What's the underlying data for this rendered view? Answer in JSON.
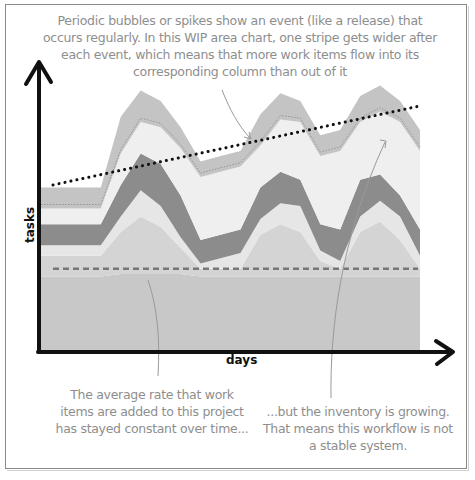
{
  "chart_data": {
    "type": "area",
    "title": "",
    "xlabel": "days",
    "ylabel": "tasks",
    "grid": false,
    "legend": "none",
    "x": [
      0,
      1,
      2,
      3,
      4,
      5,
      6,
      7,
      8,
      9,
      10,
      11,
      12,
      13,
      14,
      15,
      16,
      17,
      18,
      19
    ],
    "ylim": [
      0,
      100
    ],
    "series": [
      {
        "name": "done",
        "color": "#c8c8c8",
        "values": [
          28,
          28,
          28,
          28,
          29,
          29,
          29,
          29,
          28,
          28,
          28,
          28,
          28,
          28,
          28,
          28,
          28,
          28,
          28,
          28
        ]
      },
      {
        "name": "stage-4",
        "color": "#d4d4d4",
        "values": [
          8,
          8,
          8,
          8,
          16,
          22,
          18,
          10,
          3,
          3,
          3,
          16,
          20,
          17,
          6,
          3,
          17,
          21,
          14,
          3
        ]
      },
      {
        "name": "stage-3",
        "color": "#e6e6e6",
        "values": [
          4,
          4,
          4,
          4,
          6,
          10,
          8,
          4,
          2,
          4,
          6,
          6,
          8,
          10,
          4,
          3,
          6,
          8,
          9,
          5
        ]
      },
      {
        "name": "stage-2",
        "color": "#8c8c8c",
        "values": [
          8,
          8,
          8,
          8,
          12,
          14,
          16,
          16,
          9,
          9,
          9,
          12,
          12,
          10,
          10,
          12,
          14,
          10,
          8,
          10
        ]
      },
      {
        "name": "stage-1",
        "color": "#efefef",
        "values": [
          6,
          6,
          6,
          6,
          12,
          12,
          14,
          18,
          24,
          24,
          24,
          16,
          20,
          22,
          26,
          30,
          22,
          24,
          28,
          30
        ]
      },
      {
        "name": "backlog",
        "color": "#c4c4c4",
        "values": [
          8,
          8,
          8,
          8,
          14,
          12,
          10,
          8,
          6,
          6,
          6,
          12,
          10,
          8,
          8,
          8,
          10,
          10,
          8,
          8
        ]
      }
    ],
    "trend_lines": [
      {
        "name": "arrival-rate",
        "style": "dashed",
        "color": "#777777",
        "from": [
          0,
          31
        ],
        "to": [
          19,
          31
        ]
      },
      {
        "name": "inventory-growth",
        "style": "dotted",
        "color": "#111111",
        "from": [
          0,
          63
        ],
        "to": [
          19,
          93
        ]
      }
    ],
    "annotations": [
      {
        "id": "top",
        "text": "Periodic bubbles or spikes show an event (like a release) that occurs regularly. In this WIP area chart, one stripe gets wider after each event, which means that more work items flow into its corresponding column than out of it"
      },
      {
        "id": "left",
        "text": "The average rate that work items are added to this project has stayed constant over time..."
      },
      {
        "id": "right",
        "text": "...but the inventory is growing. That means this workflow is not a stable system."
      }
    ]
  },
  "notes": {
    "top": "Periodic bubbles or spikes show an event (like a release) that occurs regularly. In this WIP area chart, one stripe gets wider after each event, which means that more work items flow into its corresponding column than out of it",
    "left": "The average rate that work items are added to this project has stayed constant over time...",
    "right": "...but the inventory is growing. That means this workflow is not a stable system."
  },
  "axes": {
    "x": "days",
    "y": "tasks"
  }
}
